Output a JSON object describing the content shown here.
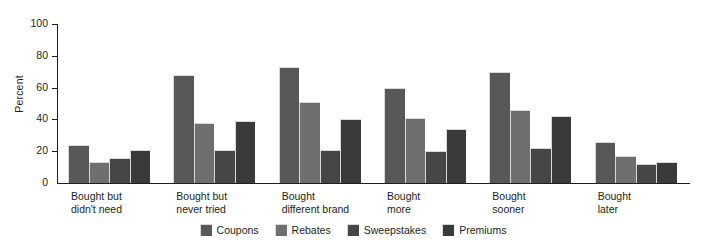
{
  "chart_data": {
    "type": "bar",
    "title": "",
    "xlabel": "",
    "ylabel": "Percent",
    "ylim": [
      0,
      100
    ],
    "yticks": [
      0,
      20,
      40,
      60,
      80,
      100
    ],
    "ytick_labels": [
      "0",
      "20",
      "40",
      "60",
      "80",
      "100"
    ],
    "grid": false,
    "legend_position": "bottom-center",
    "categories": [
      "Bought but\ndidn't need",
      "Bought but\nnever tried",
      "Bought\ndifferent brand",
      "Bought\nmore",
      "Bought\nsooner",
      "Bought\nlater"
    ],
    "series": [
      {
        "name": "Coupons",
        "color": "#585858",
        "values": [
          24,
          68,
          73,
          60,
          70,
          26
        ]
      },
      {
        "name": "Rebates",
        "color": "#6f6f6f",
        "values": [
          13,
          38,
          51,
          41,
          46,
          17
        ]
      },
      {
        "name": "Sweepstakes",
        "color": "#464646",
        "values": [
          16,
          21,
          21,
          20,
          22,
          12
        ]
      },
      {
        "name": "Premiums",
        "color": "#3a3a3a",
        "values": [
          21,
          39,
          40,
          34,
          42,
          13
        ]
      }
    ]
  },
  "axis": {
    "y_title": "Percent"
  },
  "legend": {
    "items": [
      {
        "label": "Coupons"
      },
      {
        "label": "Rebates"
      },
      {
        "label": "Sweepstakes"
      },
      {
        "label": "Premiums"
      }
    ]
  }
}
